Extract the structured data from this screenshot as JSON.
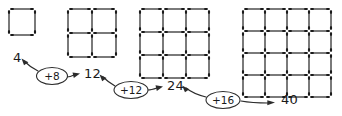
{
  "figure": {
    "style": {
      "background": "#ffffff",
      "ink": "#2b2b2b",
      "cap": "#1a1a1a"
    }
  },
  "diagram_data": {
    "type": "diagram",
    "description": "Growing sequence of matchstick square grids with a number chain showing the count of matchsticks and the difference between consecutive terms.",
    "grids": [
      {
        "name": "grid-1",
        "rows": 1,
        "cols": 1,
        "stick_count": 4,
        "origin_x": 9,
        "origin_y": 9,
        "cell": 26
      },
      {
        "name": "grid-2",
        "rows": 2,
        "cols": 2,
        "stick_count": 12,
        "origin_x": 68,
        "origin_y": 9,
        "cell": 24
      },
      {
        "name": "grid-3",
        "rows": 3,
        "cols": 3,
        "stick_count": 24,
        "origin_x": 140,
        "origin_y": 9,
        "cell": 23
      },
      {
        "name": "grid-4",
        "rows": 4,
        "cols": 4,
        "stick_count": 40,
        "origin_x": 243,
        "origin_y": 9,
        "cell": 22
      }
    ],
    "terms": [
      {
        "label": "4",
        "x": 13,
        "y": 62
      },
      {
        "label": "12",
        "x": 84,
        "y": 78
      },
      {
        "label": "24",
        "x": 167,
        "y": 90
      },
      {
        "label": "40",
        "x": 281,
        "y": 104
      }
    ],
    "differences": [
      {
        "label": "+8",
        "cx": 52,
        "cy": 76
      },
      {
        "label": "+12",
        "cx": 131,
        "cy": 90
      },
      {
        "label": "+16",
        "cx": 223,
        "cy": 100
      }
    ],
    "sequence_values": [
      4,
      12,
      24,
      40
    ],
    "difference_values": [
      8,
      12,
      16
    ],
    "second_difference": 4
  },
  "labels": {
    "term_1": "4",
    "term_2": "12",
    "term_3": "24",
    "term_4": "40",
    "diff_1": "+8",
    "diff_2": "+12",
    "diff_3": "+16"
  }
}
